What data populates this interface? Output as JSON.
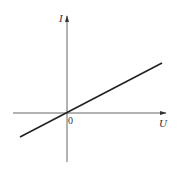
{
  "diagram": {
    "type": "I-U graph",
    "y_axis_label": "I",
    "x_axis_label": "U",
    "origin_label": "0",
    "line_description": "straight line through origin with positive slope",
    "colors": {
      "axis": "#555555",
      "line": "#222222",
      "text": "#333333"
    }
  }
}
